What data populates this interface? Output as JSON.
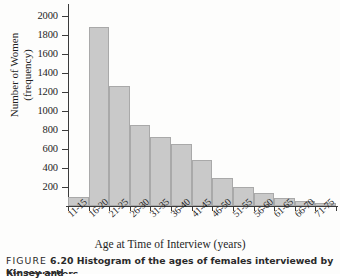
{
  "chart_data": {
    "type": "bar",
    "title": "",
    "subtitle": "",
    "xlabel": "Age at Time of Interview (years)",
    "ylabel_line1": "Number of Women",
    "ylabel_line2": "(frequency)",
    "categories": [
      "11-15",
      "16-20",
      "21-25",
      "26-30",
      "31-35",
      "36-40",
      "41-45",
      "46-50",
      "51-55",
      "56-60",
      "61-65",
      "66-70",
      "71-75"
    ],
    "values": [
      100,
      1880,
      1265,
      855,
      725,
      650,
      480,
      300,
      195,
      140,
      85,
      50,
      30
    ],
    "ylim": [
      0,
      2080
    ],
    "yticks": [
      200,
      400,
      600,
      800,
      1000,
      1200,
      1400,
      1600,
      1800,
      2000
    ],
    "ytick_labels": [
      "200",
      "400",
      "600",
      "800",
      "1000",
      "1200",
      "1400",
      "1600",
      "1800",
      "2000"
    ],
    "grid": false,
    "legend": "none",
    "bar_color": "#c9c9c9",
    "bar_edge_color": "#a9a9a9",
    "axis_color": "#3b3b3b"
  },
  "caption": {
    "figure_tag": "FIGURE",
    "figure_number": "6.20",
    "text": "Histogram of the ages of females interviewed by Kinsey and",
    "text_line2": "his coworkers"
  }
}
